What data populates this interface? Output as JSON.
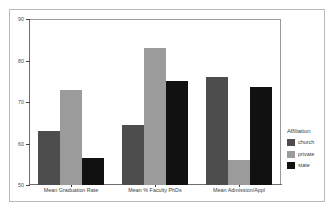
{
  "chart_data": {
    "type": "bar",
    "title": "",
    "subtitle": "",
    "xlabel": "",
    "ylabel": "",
    "ylim": [
      50,
      90
    ],
    "yticks": [
      50,
      60,
      70,
      80,
      90
    ],
    "ytick_labels": [
      "50",
      "60",
      "70",
      "80",
      "90"
    ],
    "grid": false,
    "legend_position": "right",
    "legend_title": "Affiliation",
    "categories": [
      "Mean Graduation Rate",
      "Mean % Faculty PhDs",
      "Mean Admission/Appl"
    ],
    "series": [
      {
        "name": "church",
        "color": "#4d4d4d",
        "values": [
          63.0,
          64.5,
          76.0
        ]
      },
      {
        "name": "private",
        "color": "#9b9b9b",
        "values": [
          73.0,
          83.0,
          56.0
        ]
      },
      {
        "name": "state",
        "color": "#111111",
        "values": [
          56.5,
          75.0,
          73.5
        ]
      }
    ]
  },
  "legend": {
    "title": "Affiliation",
    "items": [
      {
        "label": "church",
        "color": "#4d4d4d"
      },
      {
        "label": "private",
        "color": "#9b9b9b"
      },
      {
        "label": "state",
        "color": "#111111"
      }
    ]
  },
  "axes": {
    "y_tick_labels": [
      "90",
      "80",
      "70",
      "60",
      "50"
    ],
    "x_tick_labels": [
      "Mean Graduation Rate",
      "Mean % Faculty PhDs",
      "Mean Admission/Appl"
    ]
  },
  "colors": {
    "figure_background": "#ffffff",
    "frame_border": "#b9b9b9",
    "panel_border": "#9a9a9a",
    "axis_line": "#6e6e6e",
    "tick_text": "#3c3c3c"
  }
}
